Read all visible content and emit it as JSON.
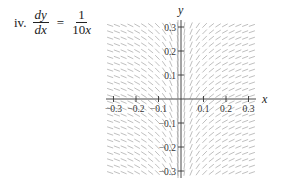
{
  "problem": {
    "number": "iv.",
    "lhs_numerator": "dy",
    "lhs_denominator": "dx",
    "equals": "=",
    "rhs_numerator": "1",
    "rhs_denominator_coef": "10",
    "rhs_denominator_var": "x"
  },
  "chart_data": {
    "type": "slope_field",
    "title": "",
    "equation": "dy/dx = 1/(10x)",
    "xlabel": "x",
    "ylabel": "y",
    "xlim": [
      -0.33,
      0.33
    ],
    "ylim": [
      -0.32,
      0.32
    ],
    "x_ticks": [
      -0.3,
      -0.2,
      -0.1,
      0.1,
      0.2,
      0.3
    ],
    "x_tick_labels": [
      "−0.3",
      "−0.2",
      "−0.1",
      "0.1",
      "0.2",
      "0.3"
    ],
    "y_ticks": [
      0.3,
      0.2,
      0.1,
      -0.1,
      -0.2,
      -0.3
    ],
    "y_tick_labels": [
      "0.3",
      "0.2",
      "0.1",
      "−0.1",
      "−0.2",
      "−0.3"
    ],
    "grid": false,
    "segment_color": "#b8b8b8",
    "axis_color": "#333333"
  }
}
